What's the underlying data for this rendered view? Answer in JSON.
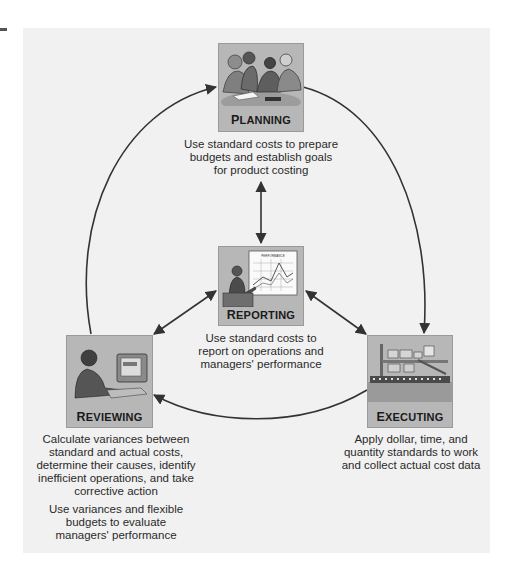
{
  "diagram": {
    "type": "cycle",
    "theme": {
      "panel_bg": "#f1f1f1",
      "stage_bg": "#b7b7b7",
      "arrow_color": "#333333"
    },
    "stages": {
      "planning": {
        "label_initial": "P",
        "label_rest": "LANNING",
        "label": "Planning",
        "icon": "team-meeting-icon",
        "description": [
          "Use standard costs to prepare",
          "budgets and establish goals",
          "for product costing"
        ]
      },
      "reporting": {
        "label_initial": "R",
        "label_rest": "EPORTING",
        "label": "Reporting",
        "icon": "presenter-chart-icon",
        "chart_caption": "PERFORMANCE",
        "description": [
          "Use standard costs to",
          "report on operations and",
          "managers' performance"
        ]
      },
      "reviewing": {
        "label_initial": "R",
        "label_rest": "EVIEWING",
        "label": "Reviewing",
        "icon": "computer-worker-icon",
        "description": [
          "Calculate variances between",
          "standard and actual costs,",
          "determine their causes, identify",
          "inefficient operations, and take",
          "corrective action"
        ],
        "description2": [
          "Use variances and flexible",
          "budgets to evaluate",
          "managers' performance"
        ]
      },
      "executing": {
        "label_initial": "E",
        "label_rest": "XECUTING",
        "label": "Executing",
        "icon": "factory-assembly-line-icon",
        "description": [
          "Apply dollar, time, and",
          "quantity standards to work",
          "and collect actual cost data"
        ]
      }
    },
    "edges": [
      {
        "from": "Planning",
        "to": "Executing",
        "style": "curved",
        "direction": "clockwise"
      },
      {
        "from": "Executing",
        "to": "Reviewing",
        "style": "curved",
        "direction": "clockwise"
      },
      {
        "from": "Reviewing",
        "to": "Planning",
        "style": "curved",
        "direction": "clockwise"
      },
      {
        "from": "Reporting",
        "to": "Planning",
        "style": "straight",
        "bidirectional": true
      },
      {
        "from": "Reporting",
        "to": "Reviewing",
        "style": "straight",
        "bidirectional": true
      },
      {
        "from": "Reporting",
        "to": "Executing",
        "style": "straight",
        "bidirectional": true
      }
    ]
  }
}
